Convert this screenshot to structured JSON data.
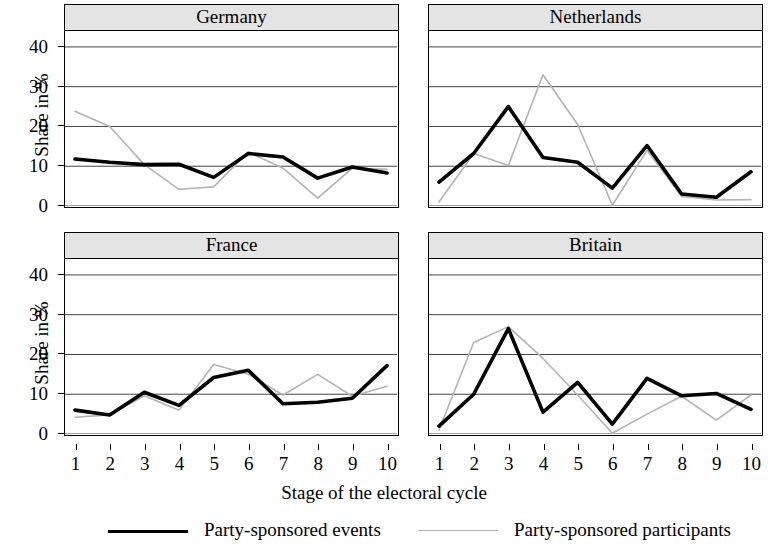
{
  "axes": {
    "ylabel": "Share in %",
    "xlabel": "Stage of the electoral cycle",
    "yticks": [
      "0",
      "10",
      "20",
      "30",
      "40"
    ],
    "xticks": [
      "1",
      "2",
      "3",
      "4",
      "5",
      "6",
      "7",
      "8",
      "9",
      "10"
    ]
  },
  "legend": {
    "items": [
      {
        "label": "Party-sponsored events",
        "color": "#000000",
        "width": 3.6
      },
      {
        "label": "Party-sponsored participants",
        "color": "#b3b3b3",
        "width": 1.6
      }
    ]
  },
  "panels": {
    "germany": {
      "title": "Germany"
    },
    "netherlands": {
      "title": "Netherlands"
    },
    "france": {
      "title": "France"
    },
    "britain": {
      "title": "Britain"
    }
  },
  "chart_data": {
    "type": "line",
    "title": "",
    "subtitle": "",
    "xlabel": "Stage of the electoral cycle",
    "ylabel": "Share in %",
    "xlim": [
      1,
      10
    ],
    "ylim": [
      0,
      44
    ],
    "yticks": [
      0,
      10,
      20,
      30,
      40
    ],
    "xticks": [
      1,
      2,
      3,
      4,
      5,
      6,
      7,
      8,
      9,
      10
    ],
    "grid": "horizontal",
    "legend_position": "bottom",
    "layout": "2x2 trellis panels by country",
    "x": [
      1,
      2,
      3,
      4,
      5,
      6,
      7,
      8,
      9,
      10
    ],
    "panels": [
      {
        "name": "Germany",
        "series": [
          {
            "name": "Party-sponsored events",
            "color": "#000000",
            "values": [
              11.8,
              11.0,
              10.4,
              10.5,
              7.2,
              13.2,
              12.3,
              7.0,
              9.8,
              8.3
            ]
          },
          {
            "name": "Party-sponsored participants",
            "color": "#b3b3b3",
            "values": [
              23.8,
              20.0,
              10.4,
              4.2,
              4.8,
              13.6,
              9.5,
              2.0,
              9.5,
              9.2
            ]
          }
        ]
      },
      {
        "name": "Netherlands",
        "series": [
          {
            "name": "Party-sponsored events",
            "color": "#000000",
            "values": [
              6.0,
              13.2,
              25.0,
              12.2,
              11.0,
              4.5,
              15.2,
              3.0,
              2.2,
              8.6
            ]
          },
          {
            "name": "Party-sponsored participants",
            "color": "#b3b3b3",
            "values": [
              1.0,
              13.2,
              10.2,
              33.0,
              20.5,
              0.2,
              14.0,
              2.4,
              1.5,
              1.6
            ]
          }
        ]
      },
      {
        "name": "France",
        "series": [
          {
            "name": "Party-sponsored events",
            "color": "#000000",
            "values": [
              6.0,
              4.8,
              10.5,
              7.2,
              14.2,
              16.0,
              7.6,
              8.0,
              9.0,
              17.2
            ]
          },
          {
            "name": "Party-sponsored participants",
            "color": "#b3b3b3",
            "values": [
              4.2,
              4.8,
              9.6,
              6.0,
              17.5,
              15.0,
              9.8,
              15.0,
              9.5,
              12.0
            ]
          }
        ]
      },
      {
        "name": "Britain",
        "series": [
          {
            "name": "Party-sponsored events",
            "color": "#000000",
            "values": [
              2.0,
              10.0,
              26.5,
              5.5,
              13.0,
              2.5,
              14.0,
              9.6,
              10.2,
              6.2
            ]
          },
          {
            "name": "Party-sponsored participants",
            "color": "#b3b3b3",
            "values": [
              1.0,
              23.0,
              27.0,
              19.0,
              9.8,
              0.2,
              5.0,
              9.5,
              3.5,
              9.8
            ]
          }
        ]
      }
    ]
  }
}
